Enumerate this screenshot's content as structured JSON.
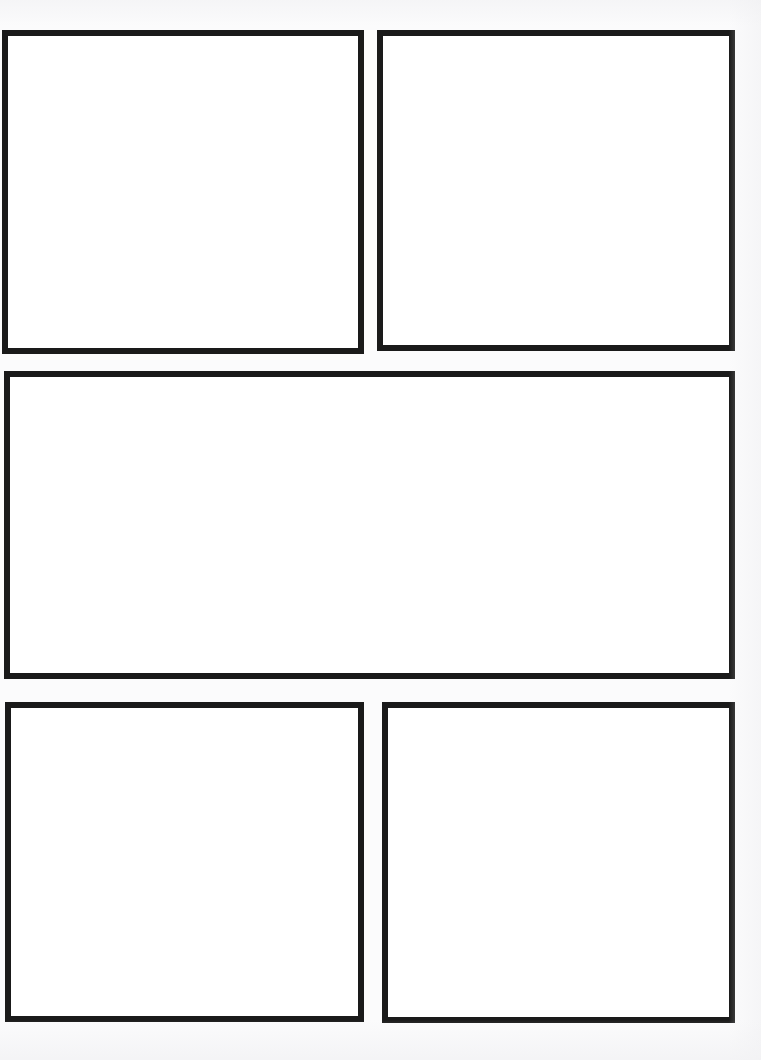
{
  "page": {
    "type": "blank-comic-panel-template",
    "width": 761,
    "height": 1060,
    "background_color": "#fbfbfc",
    "paper_color": "#ffffff",
    "border_color": "#1a1a1a",
    "border_width": 6,
    "row_count": 3,
    "panel_count": 5,
    "content_text": ""
  },
  "panels": [
    {
      "id": "panel-1",
      "label": "",
      "row": 1,
      "column": 1,
      "x": 2,
      "y": 30,
      "width": 362,
      "height": 324,
      "fill": "#ffffff",
      "border_color": "#1a1a1a",
      "border_width": 6
    },
    {
      "id": "panel-2",
      "label": "",
      "row": 1,
      "column": 2,
      "x": 377,
      "y": 30,
      "width": 358,
      "height": 321,
      "fill": "#ffffff",
      "border_color": "#1a1a1a",
      "border_width": 6
    },
    {
      "id": "panel-3",
      "label": "",
      "row": 2,
      "column": 1,
      "x": 4,
      "y": 371,
      "width": 731,
      "height": 308,
      "fill": "#ffffff",
      "border_color": "#1a1a1a",
      "border_width": 6
    },
    {
      "id": "panel-4",
      "label": "",
      "row": 3,
      "column": 1,
      "x": 5,
      "y": 702,
      "width": 359,
      "height": 320,
      "fill": "#ffffff",
      "border_color": "#1a1a1a",
      "border_width": 6
    },
    {
      "id": "panel-5",
      "label": "",
      "row": 3,
      "column": 2,
      "x": 382,
      "y": 702,
      "width": 353,
      "height": 321,
      "fill": "#ffffff",
      "border_color": "#1a1a1a",
      "border_width": 6
    }
  ]
}
